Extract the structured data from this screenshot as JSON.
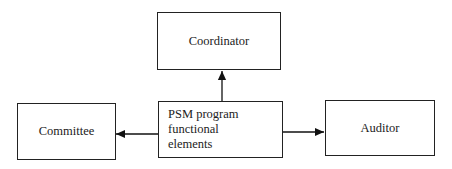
{
  "diagram": {
    "nodes": {
      "coordinator": "Coordinator",
      "center": "PSM program functional elements",
      "center_line1": "PSM program functional",
      "center_line2": "elements",
      "committee": "Committee",
      "auditor": "Auditor"
    },
    "edges": [
      {
        "from": "PSM program functional elements",
        "to": "Coordinator"
      },
      {
        "from": "PSM program functional elements",
        "to": "Committee"
      },
      {
        "from": "PSM program functional elements",
        "to": "Auditor"
      }
    ]
  }
}
